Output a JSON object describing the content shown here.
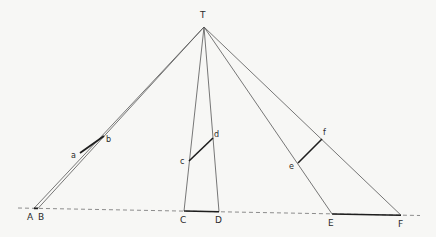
{
  "diagram": {
    "title": "",
    "apex_label": "T",
    "baseline_points": [
      "A",
      "B",
      "C",
      "D",
      "E",
      "F"
    ],
    "segments": [
      {
        "name": "ab",
        "from": "a",
        "to": "b"
      },
      {
        "name": "cd",
        "from": "c",
        "to": "d"
      },
      {
        "name": "ef",
        "from": "e",
        "to": "f"
      }
    ],
    "base_segments": [
      {
        "name": "AB",
        "from": "A",
        "to": "B"
      },
      {
        "name": "CD",
        "from": "C",
        "to": "D"
      },
      {
        "name": "EF",
        "from": "E",
        "to": "F"
      }
    ],
    "labels": {
      "T": "T",
      "A": "A",
      "B": "B",
      "C": "C",
      "D": "D",
      "E": "E",
      "F": "F",
      "a": "a",
      "b": "b",
      "c": "c",
      "d": "d",
      "e": "e",
      "f": "f"
    },
    "colors": {
      "line": "#4a4a4a",
      "thick": "#1e1e1e",
      "dashed": "#777777"
    }
  }
}
